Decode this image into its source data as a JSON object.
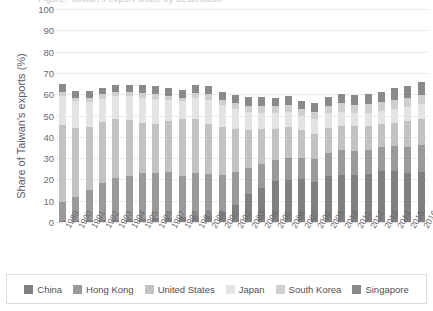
{
  "title_cutoff": "Figure: Taiwan's export share by destination",
  "chart_data": {
    "type": "bar",
    "subtype": "stacked-column",
    "title": "",
    "xlabel": "",
    "ylabel": "Share of Taiwan's exports (%)",
    "ylim": [
      0,
      100
    ],
    "ytick_labels": [
      "0",
      "10",
      "20",
      "30",
      "40",
      "50",
      "60",
      "70",
      "80",
      "90",
      "100"
    ],
    "ytick_values": [
      0,
      10,
      20,
      30,
      40,
      50,
      60,
      70,
      80,
      90,
      100
    ],
    "grid": true,
    "legend_position": "bottom",
    "legend_entries": [
      "China",
      "Hong Kong",
      "United States",
      "Japan",
      "South Korea",
      "Singapore"
    ],
    "colors": {
      "China": "#808080",
      "Hong Kong": "#9a9a9a",
      "United States": "#c2c2c2",
      "Japan": "#e3e3e3",
      "South Korea": "#cfcfcf",
      "Singapore": "#8a8a8a"
    },
    "categories": [
      "1989",
      "1990",
      "1991",
      "1992",
      "1993",
      "1994",
      "1995",
      "1996",
      "1997",
      "1998",
      "1999",
      "2000",
      "2001",
      "2002",
      "2003",
      "2004",
      "2005",
      "2006",
      "2007",
      "2008",
      "2009",
      "2010",
      "2011",
      "2012",
      "2013",
      "2014",
      "2015",
      "2016"
    ],
    "series": [
      {
        "name": "China",
        "color": "#808080",
        "values": [
          0.4,
          0.6,
          0.8,
          1.0,
          1.1,
          1.3,
          1.6,
          1.9,
          2.1,
          2.4,
          2.6,
          2.9,
          4.8,
          7.8,
          13.3,
          16.2,
          19.1,
          19.8,
          20.1,
          19.0,
          21.4,
          22.3,
          22.2,
          22.7,
          23.8,
          23.9,
          22.9,
          23.5
        ]
      },
      {
        "name": "Hong Kong",
        "color": "#9a9a9a",
        "values": [
          9.0,
          11.2,
          14.3,
          17.1,
          19.7,
          20.5,
          21.3,
          21.0,
          21.2,
          19.2,
          20.4,
          19.6,
          17.1,
          15.5,
          12.0,
          11.2,
          9.9,
          10.2,
          10.1,
          10.5,
          11.1,
          11.5,
          11.2,
          11.3,
          11.5,
          11.8,
          12.3,
          12.8
        ]
      },
      {
        "name": "United States",
        "color": "#c2c2c2",
        "values": [
          36.2,
          32.4,
          29.3,
          28.9,
          27.6,
          26.2,
          23.7,
          23.2,
          24.2,
          26.6,
          25.4,
          23.5,
          22.5,
          20.5,
          18.0,
          16.2,
          14.7,
          14.5,
          13.0,
          12.0,
          11.6,
          11.5,
          11.8,
          10.9,
          10.7,
          11.0,
          12.1,
          12.0
        ]
      },
      {
        "name": "Japan",
        "color": "#e3e3e3",
        "values": [
          13.7,
          12.4,
          12.1,
          10.9,
          10.6,
          11.0,
          11.8,
          11.8,
          9.6,
          8.4,
          9.8,
          11.2,
          10.4,
          9.2,
          8.3,
          7.6,
          7.6,
          7.3,
          6.5,
          6.9,
          7.1,
          6.6,
          5.9,
          6.3,
          6.3,
          6.4,
          6.9,
          6.9
        ]
      },
      {
        "name": "South Korea",
        "color": "#cfcfcf",
        "values": [
          1.6,
          1.8,
          1.9,
          2.0,
          2.2,
          2.2,
          2.4,
          2.3,
          2.3,
          1.8,
          2.4,
          2.7,
          2.6,
          2.7,
          3.0,
          3.1,
          3.0,
          3.2,
          3.2,
          3.3,
          3.4,
          3.9,
          4.0,
          4.1,
          4.1,
          4.2,
          4.1,
          4.4
        ]
      },
      {
        "name": "Singapore",
        "color": "#8a8a8a",
        "values": [
          3.7,
          3.3,
          3.2,
          3.2,
          3.2,
          3.2,
          3.5,
          3.6,
          3.7,
          3.6,
          3.9,
          4.0,
          3.8,
          4.1,
          4.1,
          4.2,
          4.0,
          4.1,
          4.1,
          4.2,
          4.1,
          4.4,
          4.5,
          4.7,
          4.7,
          5.6,
          5.6,
          6.0
        ]
      }
    ]
  }
}
